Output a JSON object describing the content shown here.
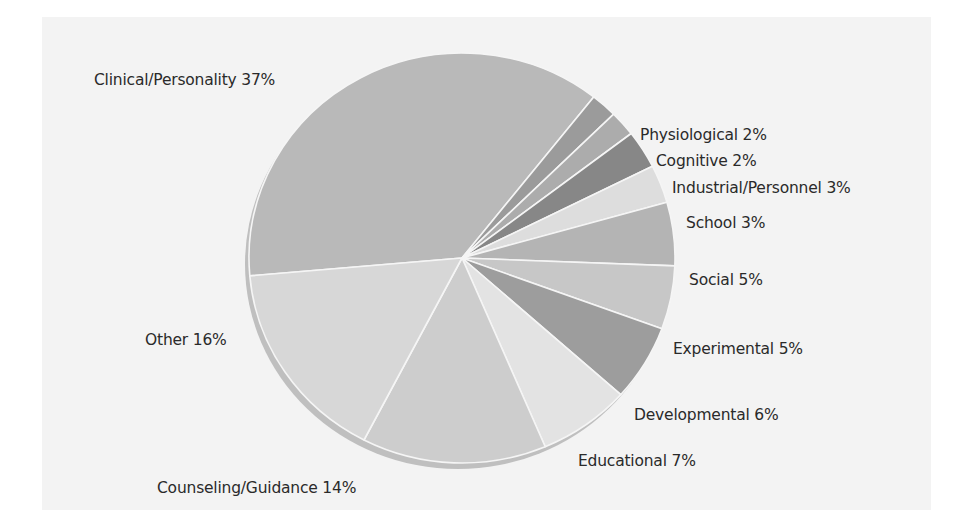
{
  "chart_data": {
    "type": "pie",
    "title": "",
    "start_angle_deg": 185,
    "direction": "clockwise-on-screen",
    "categories": [
      "Clinical/Personality",
      "Physiological",
      "Cognitive",
      "Industrial/Personnel",
      "School",
      "Social",
      "Experimental",
      "Developmental",
      "Educational",
      "Counseling/Guidance",
      "Other"
    ],
    "values": [
      37,
      2,
      2,
      3,
      3,
      5,
      5,
      6,
      7,
      14,
      16
    ],
    "unit": "%",
    "colors": [
      "#b9b9b9",
      "#9b9b9b",
      "#acacac",
      "#878787",
      "#dddddd",
      "#b4b4b4",
      "#c7c7c7",
      "#9d9d9d",
      "#e3e3e3",
      "#cdcdcd",
      "#d7d7d7"
    ],
    "labels": [
      {
        "text": "Clinical/Personality 37%",
        "x": 94,
        "y": 84
      },
      {
        "text": "Physiological 2%",
        "x": 640,
        "y": 139
      },
      {
        "text": "Cognitive 2%",
        "x": 656,
        "y": 165
      },
      {
        "text": "Industrial/Personnel 3%",
        "x": 672,
        "y": 192
      },
      {
        "text": "School 3%",
        "x": 686,
        "y": 227
      },
      {
        "text": "Social 5%",
        "x": 689,
        "y": 284
      },
      {
        "text": "Experimental 5%",
        "x": 673,
        "y": 353
      },
      {
        "text": "Developmental 6%",
        "x": 634,
        "y": 419
      },
      {
        "text": "Educational 7%",
        "x": 578,
        "y": 465
      },
      {
        "text": "Counseling/Guidance 14%",
        "x": 157,
        "y": 492
      },
      {
        "text": "Other 16%",
        "x": 145,
        "y": 344
      }
    ],
    "legend": "none (inline slice labels)",
    "geometry": {
      "cx": 462,
      "cy": 258,
      "rx": 213,
      "ry": 205,
      "shadow_color": "#bfbfbf",
      "separator_color": "#f5f5f5"
    }
  }
}
